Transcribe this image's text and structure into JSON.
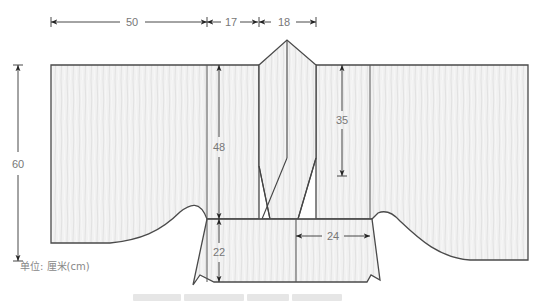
{
  "diagram": {
    "type": "garment-pattern-schematic",
    "garment": "cardigan with shawl collar (flat layout)",
    "dimensions": {
      "top_left_width": "50",
      "top_middle_width": "17",
      "top_collar_width": "18",
      "total_height": "60",
      "front_height": "48",
      "collar_drop": "35",
      "waistband_height": "22",
      "waistband_width": "24"
    },
    "unit_label": "单位: 厘米(cm)",
    "colors": {
      "fabric_fill": "#f1f1f1",
      "outline": "#4a4a4a",
      "dimension_line": "#333333",
      "dimension_text": "#777777"
    }
  }
}
